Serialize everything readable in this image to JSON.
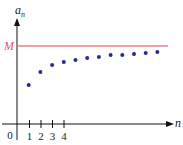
{
  "chart_data": {
    "type": "scatter",
    "title": "",
    "xlabel": "n",
    "ylabel": "a_n",
    "origin_label": "0",
    "x_tick_labels": [
      "1",
      "2",
      "3",
      "4"
    ],
    "reference_line": {
      "label": "M",
      "color": "#e8808a"
    },
    "point_color": "#1f2f8f",
    "x": [
      1,
      2,
      3,
      4,
      5,
      6,
      7,
      8,
      9,
      10,
      11,
      12
    ],
    "y_pixels_from_axis": [
      39,
      52,
      59,
      62,
      64,
      66,
      67,
      69,
      69,
      70,
      71,
      72
    ],
    "grid": false,
    "legend": "none"
  },
  "labels": {
    "y_axis": "a",
    "y_axis_sub": "n",
    "x_axis": "n",
    "origin": "0",
    "bound": "M"
  }
}
